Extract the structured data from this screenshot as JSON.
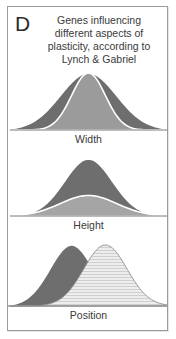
{
  "figure": {
    "panel_letter": "D",
    "caption_lines": [
      "Genes influencing",
      "different aspects of",
      "plasticity, according to",
      "Lynch & Gabriel"
    ],
    "border_color": "#9a9a9a",
    "background_color": "#ffffff",
    "text_color": "#3a3a3a"
  },
  "panels": [
    {
      "id": "width",
      "label": "Width",
      "description": "Two normal curves with the same mean and height but different standard deviations",
      "curves": [
        {
          "name": "wide-curve",
          "fill": "#6e6e6e",
          "stroke": "#ffffff",
          "mean": 0.5,
          "sd": 0.175,
          "peak": 1.0,
          "pattern": "solid"
        },
        {
          "name": "narrow-curve",
          "fill": "#9b9b9b",
          "stroke": "#ffffff",
          "mean": 0.5,
          "sd": 0.105,
          "peak": 1.0,
          "pattern": "solid"
        }
      ]
    },
    {
      "id": "height",
      "label": "Height",
      "description": "Two normal curves with the same mean and width but different peak heights",
      "curves": [
        {
          "name": "tall-curve",
          "fill": "#6e6e6e",
          "stroke": "#ffffff",
          "mean": 0.5,
          "sd": 0.15,
          "peak": 1.0,
          "pattern": "solid"
        },
        {
          "name": "short-curve",
          "fill": "#a5a5a5",
          "stroke": "#ffffff",
          "mean": 0.5,
          "sd": 0.175,
          "peak": 0.36,
          "pattern": "solid"
        }
      ]
    },
    {
      "id": "position",
      "label": "Position",
      "description": "Two normal curves of equal width and height shifted along the x axis",
      "curves": [
        {
          "name": "left-curve",
          "fill": "#6e6e6e",
          "stroke": "#ffffff",
          "mean": 0.395,
          "sd": 0.135,
          "peak": 1.0,
          "pattern": "solid"
        },
        {
          "name": "right-curve",
          "fill": "#e2e2e2",
          "stroke": "#8c8c8c",
          "mean": 0.605,
          "sd": 0.135,
          "peak": 1.0,
          "pattern": "horizontal-stripes"
        }
      ]
    }
  ],
  "chart_data": {
    "type": "line",
    "title": "Genes influencing different aspects of plasticity, according to Lynch & Gabriel",
    "xlabel": "",
    "ylabel": "",
    "grid": false,
    "legend_position": "none",
    "subplots": [
      {
        "name": "Width",
        "xlim": [
          0,
          1
        ],
        "ylim": [
          0,
          1
        ],
        "series": [
          {
            "name": "wide-curve",
            "distribution": "normal",
            "mean": 0.5,
            "sd": 0.175,
            "peak": 1.0,
            "color": "#6e6e6e"
          },
          {
            "name": "narrow-curve",
            "distribution": "normal",
            "mean": 0.5,
            "sd": 0.105,
            "peak": 1.0,
            "color": "#9b9b9b"
          }
        ]
      },
      {
        "name": "Height",
        "xlim": [
          0,
          1
        ],
        "ylim": [
          0,
          1
        ],
        "series": [
          {
            "name": "tall-curve",
            "distribution": "normal",
            "mean": 0.5,
            "sd": 0.15,
            "peak": 1.0,
            "color": "#6e6e6e"
          },
          {
            "name": "short-curve",
            "distribution": "normal",
            "mean": 0.5,
            "sd": 0.175,
            "peak": 0.36,
            "color": "#a5a5a5"
          }
        ]
      },
      {
        "name": "Position",
        "xlim": [
          0,
          1
        ],
        "ylim": [
          0,
          1
        ],
        "series": [
          {
            "name": "left-curve",
            "distribution": "normal",
            "mean": 0.395,
            "sd": 0.135,
            "peak": 1.0,
            "color": "#6e6e6e"
          },
          {
            "name": "right-curve",
            "distribution": "normal",
            "mean": 0.605,
            "sd": 0.135,
            "peak": 1.0,
            "color": "#e2e2e2"
          }
        ]
      }
    ]
  }
}
